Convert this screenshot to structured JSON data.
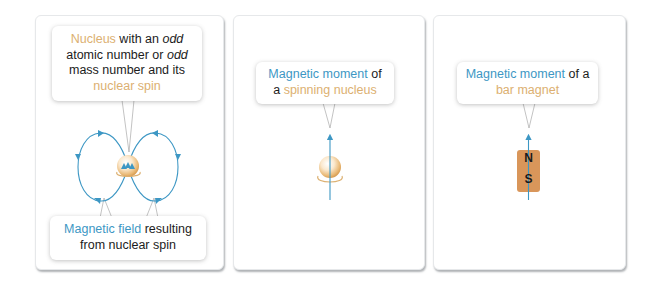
{
  "colors": {
    "field_blue": "#3d97c4",
    "nucleus_orange": "#dcb071",
    "magnet_fill": "#d9965a",
    "text_dark": "#1c1c1c"
  },
  "panels": [
    {
      "id": "nucleus-spin",
      "top_callout": {
        "part1": "Nucleus",
        "part2": " with an ",
        "part3": "odd",
        "part4": " atomic number or ",
        "part5": "odd",
        "part6": " mass number and its ",
        "part7": "nuclear spin"
      },
      "bottom_callout": {
        "part1": "Magnetic field",
        "part2": " resulting from nuclear spin"
      }
    },
    {
      "id": "spinning-nucleus",
      "callout": {
        "part1": "Magnetic moment",
        "part2": " of a ",
        "part3": "spinning nucleus"
      }
    },
    {
      "id": "bar-magnet",
      "callout": {
        "part1": "Magnetic moment",
        "part2": " of a ",
        "part3": "bar magnet"
      },
      "magnet": {
        "north": "N",
        "south": "S"
      }
    }
  ]
}
